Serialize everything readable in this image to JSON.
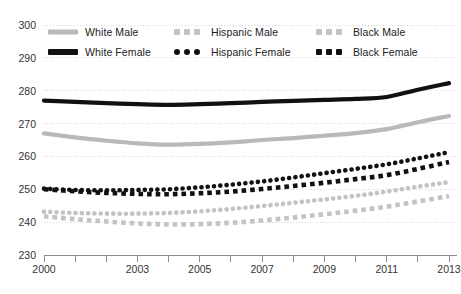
{
  "chart_data": {
    "type": "line",
    "title": "",
    "subtitle": "",
    "xlabel": "",
    "ylabel": "",
    "xlim": [
      2000,
      2013
    ],
    "ylim": [
      230,
      300
    ],
    "yticks": [
      230,
      240,
      250,
      260,
      270,
      280,
      290,
      300
    ],
    "xticks": [
      2000,
      2001,
      2002,
      2003,
      2004,
      2005,
      2006,
      2007,
      2008,
      2009,
      2010,
      2011,
      2012,
      2013
    ],
    "xtick_labels_shown": [
      2000,
      2003,
      2005,
      2007,
      2009,
      2011,
      2013
    ],
    "grid": "horizontal-dotted",
    "legend_position": "top",
    "x": [
      2000,
      2001,
      2002,
      2003,
      2004,
      2005,
      2006,
      2007,
      2008,
      2009,
      2010,
      2011,
      2012,
      2013
    ],
    "series": [
      {
        "name": "White Male",
        "style": "solid",
        "color": "#b9b9b9",
        "values": [
          267.0,
          265.8,
          264.8,
          264.0,
          263.6,
          263.8,
          264.3,
          265.0,
          265.6,
          266.3,
          267.1,
          268.3,
          270.4,
          272.3
        ]
      },
      {
        "name": "White Female",
        "style": "solid",
        "color": "#111111",
        "values": [
          277.0,
          276.6,
          276.2,
          275.9,
          275.7,
          275.9,
          276.2,
          276.6,
          276.9,
          277.2,
          277.5,
          278.1,
          280.3,
          282.3
        ]
      },
      {
        "name": "Hispanic Male",
        "style": "dotted",
        "color": "#c3c3c3",
        "values": [
          243.2,
          242.8,
          242.6,
          242.6,
          242.8,
          243.3,
          244.0,
          244.9,
          245.9,
          246.9,
          248.0,
          249.3,
          250.8,
          252.2
        ]
      },
      {
        "name": "Hispanic Female",
        "style": "dotted",
        "color": "#111111",
        "values": [
          250.2,
          249.8,
          249.7,
          249.8,
          250.0,
          250.6,
          251.4,
          252.4,
          253.6,
          254.9,
          256.2,
          257.6,
          259.4,
          261.3
        ]
      },
      {
        "name": "Black Male",
        "style": "dashed",
        "color": "#c3c3c3",
        "values": [
          241.8,
          240.9,
          240.2,
          239.6,
          239.3,
          239.4,
          239.8,
          240.5,
          241.4,
          242.4,
          243.5,
          244.7,
          246.3,
          247.9
        ]
      },
      {
        "name": "Black Female",
        "style": "dashed",
        "color": "#111111",
        "values": [
          250.0,
          249.4,
          248.9,
          248.6,
          248.5,
          248.8,
          249.3,
          250.1,
          251.0,
          252.0,
          253.1,
          254.3,
          256.2,
          258.3
        ]
      }
    ],
    "legend_entries": [
      {
        "label": "White Male",
        "style": "solid",
        "color": "#b9b9b9"
      },
      {
        "label": "Hispanic Male",
        "style": "dotted",
        "color": "#c3c3c3"
      },
      {
        "label": "Black Male",
        "style": "dashed",
        "color": "#c3c3c3"
      },
      {
        "label": "White Female",
        "style": "solid",
        "color": "#111111"
      },
      {
        "label": "Hispanic Female",
        "style": "dotted",
        "color": "#111111"
      },
      {
        "label": "Black Female",
        "style": "dashed",
        "color": "#111111"
      }
    ],
    "colors": {
      "light_gray": "#c3c3c3",
      "mid_gray": "#b9b9b9",
      "black": "#111111",
      "gridline": "#d5d5d5",
      "axis": "#8a8a8a",
      "text": "#333333",
      "background": "#ffffff"
    }
  }
}
